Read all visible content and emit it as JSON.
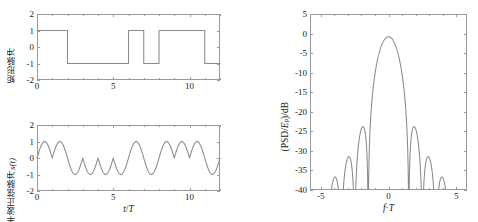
{
  "figure": {
    "panels": [
      "rect-pulse-waveform",
      "half-sine-pulse-waveform",
      "psd-spectrum"
    ]
  },
  "chart_data": [
    {
      "id": "rect-pulse",
      "type": "line",
      "title": "",
      "xlabel": "",
      "ylabel": "矩形脉冲",
      "xlim": [
        0,
        12
      ],
      "ylim": [
        -2,
        2
      ],
      "xticks": [
        0,
        5,
        10
      ],
      "xtick_labels": [
        "0",
        "5",
        "10"
      ],
      "xticks_minor": [
        1,
        2,
        3,
        4,
        6,
        7,
        8,
        9,
        11,
        12
      ],
      "yticks": [
        -2,
        -1,
        0,
        1,
        2
      ],
      "ytick_labels": [
        "-2",
        "-1",
        "0",
        "1",
        "2"
      ],
      "grid": false,
      "legend": "none",
      "bit_symbols": [
        1,
        1,
        -1,
        -1,
        -1,
        -1,
        1,
        -1,
        1,
        1,
        1,
        -1
      ],
      "x": [
        0,
        2,
        2,
        6,
        6,
        7,
        7,
        8,
        8,
        11,
        11,
        12
      ],
      "y": [
        1,
        1,
        -1,
        -1,
        1,
        1,
        -1,
        -1,
        1,
        1,
        -1,
        -1
      ],
      "series": [
        {
          "name": "矩形脉冲",
          "color": "#8a8a8a"
        }
      ]
    },
    {
      "id": "half-sine-pulse",
      "type": "line",
      "title": "",
      "xlabel": "t/T",
      "ylabel": "半波正弦脉冲s(t)",
      "xlim": [
        0,
        12
      ],
      "ylim": [
        -2,
        2
      ],
      "xticks": [
        0,
        5,
        10
      ],
      "xtick_labels": [
        "0",
        "5",
        "10"
      ],
      "xticks_minor": [
        1,
        2,
        3,
        4,
        6,
        7,
        8,
        9,
        11,
        12
      ],
      "yticks": [
        -2,
        -1,
        0,
        1,
        2
      ],
      "ytick_labels": [
        "-2",
        "-1",
        "0",
        "1",
        "2"
      ],
      "grid": false,
      "legend": "none",
      "bit_symbols": [
        1,
        1,
        -1,
        -1,
        -1,
        -1,
        1,
        -1,
        1,
        1,
        1,
        -1
      ],
      "pulse_shape": "half-sine, one half-period per bit interval, amplitude 1",
      "series": [
        {
          "name": "s(t)",
          "color": "#8a8a8a"
        }
      ]
    },
    {
      "id": "psd",
      "type": "line",
      "title": "",
      "xlabel": "f·T",
      "ylabel": "(PSD/Ep)/dB",
      "xlim": [
        -5.8,
        5.8
      ],
      "ylim": [
        -40,
        5
      ],
      "xticks": [
        -5,
        0,
        5
      ],
      "xtick_labels": [
        "-5",
        "0",
        "5"
      ],
      "xticks_minor": [
        -4,
        -3,
        -2,
        -1,
        1,
        2,
        3,
        4
      ],
      "yticks": [
        -40,
        -35,
        -30,
        -25,
        -20,
        -15,
        -10,
        -5,
        0,
        5
      ],
      "ytick_labels": [
        "-40",
        "-35",
        "-30",
        "-25",
        "-20",
        "-15",
        "-10",
        "-5",
        "0",
        "5"
      ],
      "grid": false,
      "legend": "none",
      "mainlobe_peak_db": -0.8,
      "mainlobe_peak_f": 0.0,
      "nulls_fT": [
        -4.5,
        -3.5,
        -2.5,
        -1.5,
        1.5,
        2.5,
        3.5,
        4.5
      ],
      "sidelobe_peaks": [
        {
          "f": -4.0,
          "db": -37.0
        },
        {
          "f": -3.0,
          "db": -31.5
        },
        {
          "f": -1.95,
          "db": -24.0
        },
        {
          "f": 1.95,
          "db": -24.0
        },
        {
          "f": 3.0,
          "db": -31.5
        },
        {
          "f": 4.0,
          "db": -37.0
        }
      ],
      "series": [
        {
          "name": "PSD of half-sine pulse train",
          "color": "#8a8a8a"
        }
      ]
    }
  ],
  "labels": {
    "psd_y_prefix": "(PSD/",
    "psd_y_E": "E",
    "psd_y_sub": "p",
    "psd_y_suffix": ")/dB",
    "left_x_t": "t",
    "left_x_slash": "/",
    "left_x_T": "T",
    "psd_x_f": "f",
    "psd_x_dot": "·",
    "psd_x_T": "T",
    "rect_y": "矩形脉冲",
    "sine_y_cjk": "半波正弦脉冲",
    "sine_y_sig": "s(t)"
  }
}
